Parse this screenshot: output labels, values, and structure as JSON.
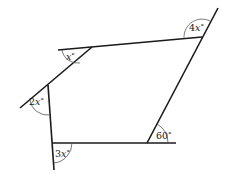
{
  "diagram": {
    "colors": {
      "line": "#1a1a1a",
      "arc": "#555555",
      "background": "#ffffff"
    },
    "vertices": {
      "top_right": [
        202,
        37
      ],
      "top_left": [
        92,
        47
      ],
      "left": [
        48,
        85
      ],
      "bottom_left": [
        52,
        143
      ],
      "bottom_right": [
        147,
        143
      ]
    },
    "lines": [
      {
        "name": "top-edge",
        "from": [
          58,
          50
        ],
        "to": [
          202,
          37
        ]
      },
      {
        "name": "right-edge-extended",
        "from": [
          147,
          143
        ],
        "to": [
          218,
          8
        ]
      },
      {
        "name": "upper-left-edge-extended",
        "from": [
          92,
          47
        ],
        "to": [
          20,
          108
        ]
      },
      {
        "name": "left-edge-extended",
        "from": [
          48,
          85
        ],
        "to": [
          54,
          170
        ]
      },
      {
        "name": "bottom-edge-extended",
        "from": [
          52,
          143
        ],
        "to": [
          176,
          143
        ]
      }
    ],
    "angles": [
      {
        "name": "angle-4x",
        "label_prefix": "4",
        "label_var": "x",
        "label_suffix": "°",
        "text_pos": [
          189,
          31
        ],
        "arc_path": "M 184 37.5 A 18 18 0 0 1 210 21"
      },
      {
        "name": "angle-x",
        "label_prefix": "",
        "label_var": "x",
        "label_suffix": "°",
        "text_pos": [
          66,
          60
        ],
        "arc_path": "M 62 50 A 16 16 0 0 0 80 63"
      },
      {
        "name": "angle-2x",
        "label_prefix": "2",
        "label_var": "x",
        "label_suffix": "°",
        "text_pos": [
          29,
          105
        ],
        "arc_path": "M 30 100 A 18 18 0 0 0 50 115"
      },
      {
        "name": "angle-3x",
        "label_prefix": "3",
        "label_var": "x",
        "label_suffix": "°",
        "text_pos": [
          55,
          157
        ],
        "arc_path": "M 72 143 A 20 20 0 0 1 54 163"
      },
      {
        "name": "angle-60",
        "label_prefix": "60",
        "label_var": "",
        "label_suffix": "°",
        "text_pos": [
          156,
          139
        ],
        "arc_path": "M 157 124 A 21 21 0 0 1 168 143"
      }
    ]
  }
}
